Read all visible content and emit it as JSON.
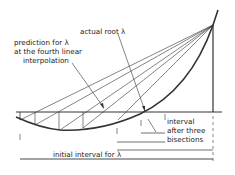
{
  "diagram": {
    "labels": {
      "actual_root": "actual root λ",
      "prediction_line1": "prediction for λ",
      "prediction_line2": "at the fourth linear",
      "prediction_line3": "interpolation",
      "interval_line1": "interval",
      "interval_line2": "after three",
      "interval_line3": "bisections",
      "initial_interval": "initial interval for λ"
    },
    "colors": {
      "ink": "#333333",
      "background": "#ffffff"
    }
  }
}
